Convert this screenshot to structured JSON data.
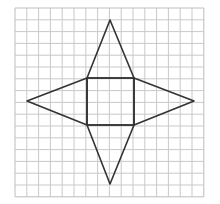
{
  "diagram": {
    "type": "pyramid-net",
    "grid": {
      "x0": 15,
      "y0": 8,
      "cols": 16,
      "rows": 16,
      "cell": 11.8,
      "line_color": "#c9c9c9",
      "border_color": "#bdbdbd"
    },
    "shape": {
      "stroke": "#333333",
      "stroke_width": 1.6,
      "square": {
        "x1": 87,
        "y1": 78,
        "x2": 134,
        "y2": 125
      },
      "apexes": {
        "top": [
          110,
          20
        ],
        "right": [
          194,
          101
        ],
        "bottom": [
          110,
          184
        ],
        "left": [
          27,
          101
        ]
      }
    }
  }
}
